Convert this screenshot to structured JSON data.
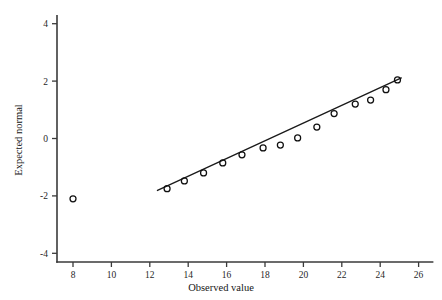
{
  "chart_data": {
    "type": "scatter",
    "title": "",
    "xlabel": "Observed value",
    "ylabel": "Expected normal",
    "xlim": [
      6.6,
      27.4
    ],
    "ylim": [
      -4.9,
      4.8
    ],
    "xticks": [
      8,
      10,
      12,
      14,
      16,
      18,
      20,
      22,
      24,
      26
    ],
    "yticks": [
      4,
      2,
      0,
      -2,
      -4
    ],
    "xtick_labels": [
      "8",
      "10",
      "12",
      "14",
      "16",
      "18",
      "20",
      "22",
      "24",
      "26"
    ],
    "ytick_labels": [
      "4",
      "2",
      "0",
      "-2",
      "-4"
    ],
    "grid": false,
    "legend": null,
    "series": [
      {
        "name": "Outlier point",
        "marker": "open-circle",
        "points": [
          {
            "x": 8.0,
            "y": -2.1
          }
        ]
      },
      {
        "name": "Normal probability points",
        "marker": "open-circle",
        "points": [
          {
            "x": 12.9,
            "y": -1.75
          },
          {
            "x": 13.8,
            "y": -1.48
          },
          {
            "x": 14.8,
            "y": -1.2
          },
          {
            "x": 15.8,
            "y": -0.85
          },
          {
            "x": 16.8,
            "y": -0.57
          },
          {
            "x": 17.9,
            "y": -0.33
          },
          {
            "x": 18.8,
            "y": -0.23
          },
          {
            "x": 19.7,
            "y": 0.02
          },
          {
            "x": 20.7,
            "y": 0.4
          },
          {
            "x": 21.6,
            "y": 0.87
          },
          {
            "x": 22.7,
            "y": 1.2
          },
          {
            "x": 23.5,
            "y": 1.34
          },
          {
            "x": 24.3,
            "y": 1.7
          },
          {
            "x": 24.9,
            "y": 2.04
          }
        ]
      }
    ],
    "fit_line": {
      "name": "reference line",
      "x_start": 12.4,
      "y_start": -1.81,
      "x_end": 25.1,
      "y_end": 2.11
    },
    "marker_radius_px": 3.0,
    "colors": {
      "axis": "#3a3a3a",
      "marker": "#101010",
      "line": "#1a1a1a",
      "background": "#ffffff"
    }
  }
}
